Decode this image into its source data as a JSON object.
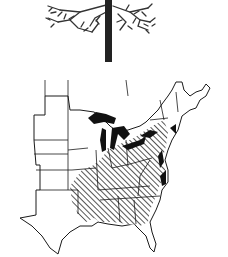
{
  "figure": {
    "panels": [
      {
        "id": "tree",
        "kind": "illustration",
        "subject": "tree-silhouette"
      },
      {
        "id": "range-map",
        "kind": "map",
        "subject": "range-map-eastern-united-states"
      }
    ]
  },
  "map": {
    "region": "Eastern United States",
    "legend_visible": false,
    "fills": {
      "range_hatch": "diagonal hatching",
      "water": "solid black (Great Lakes / coast)"
    },
    "colors": {
      "ink": "#1a1a1a",
      "background": "#ffffff",
      "hatch": "#2a2a2a"
    }
  },
  "tree": {
    "colors": {
      "trunk": "#222222",
      "foliage": "#333333"
    }
  }
}
